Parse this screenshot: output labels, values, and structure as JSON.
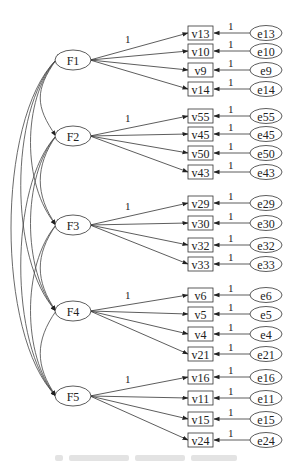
{
  "diagram": {
    "type": "structural-equation-model",
    "factors": [
      {
        "id": "F1",
        "label": "F1",
        "cx": 73,
        "cy": 60,
        "indicators": [
          {
            "label": "v13",
            "y": 33,
            "error": "e13"
          },
          {
            "label": "v10",
            "y": 51,
            "error": "e10"
          },
          {
            "label": "v9",
            "y": 70,
            "error": "e9"
          },
          {
            "label": "v14",
            "y": 89,
            "error": "e14"
          }
        ]
      },
      {
        "id": "F2",
        "label": "F2",
        "cx": 73,
        "cy": 136,
        "indicators": [
          {
            "label": "v55",
            "y": 116,
            "error": "e55"
          },
          {
            "label": "v45",
            "y": 134,
            "error": "e45"
          },
          {
            "label": "v50",
            "y": 153,
            "error": "e50"
          },
          {
            "label": "v43",
            "y": 172,
            "error": "e43"
          }
        ]
      },
      {
        "id": "F3",
        "label": "F3",
        "cx": 73,
        "cy": 225,
        "indicators": [
          {
            "label": "v29",
            "y": 203,
            "error": "e29"
          },
          {
            "label": "v30",
            "y": 223,
            "error": "e30"
          },
          {
            "label": "v32",
            "y": 245,
            "error": "e32"
          },
          {
            "label": "v33",
            "y": 264,
            "error": "e33"
          }
        ]
      },
      {
        "id": "F4",
        "label": "F4",
        "cx": 73,
        "cy": 311,
        "indicators": [
          {
            "label": "v6",
            "y": 295,
            "error": "e6"
          },
          {
            "label": "v5",
            "y": 314,
            "error": "e5"
          },
          {
            "label": "v4",
            "y": 334,
            "error": "e4"
          },
          {
            "label": "v21",
            "y": 354,
            "error": "e21"
          }
        ]
      },
      {
        "id": "F5",
        "label": "F5",
        "cx": 73,
        "cy": 396,
        "indicators": [
          {
            "label": "v16",
            "y": 377,
            "error": "e16"
          },
          {
            "label": "v11",
            "y": 398,
            "error": "e11"
          },
          {
            "label": "v15",
            "y": 419,
            "error": "e15"
          },
          {
            "label": "v24",
            "y": 440,
            "error": "e24"
          }
        ]
      }
    ],
    "loading_label": "1",
    "error_path_label": "1",
    "covariances": [
      [
        "F1",
        "F2"
      ],
      [
        "F1",
        "F3"
      ],
      [
        "F1",
        "F4"
      ],
      [
        "F1",
        "F5"
      ],
      [
        "F2",
        "F3"
      ],
      [
        "F2",
        "F4"
      ],
      [
        "F2",
        "F5"
      ],
      [
        "F3",
        "F4"
      ],
      [
        "F3",
        "F5"
      ],
      [
        "F4",
        "F5"
      ]
    ],
    "colors": {
      "stroke": "#333333",
      "text": "#222222",
      "background": "#ffffff"
    }
  },
  "caption": {
    "text_legible": false
  }
}
